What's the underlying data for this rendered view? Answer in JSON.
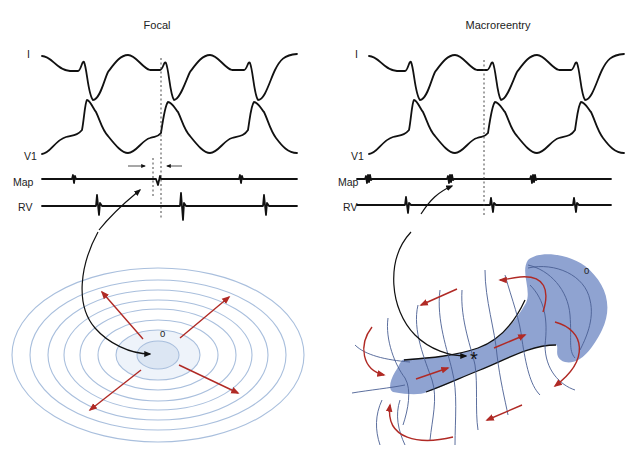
{
  "panels": [
    {
      "id": "focal",
      "title": "Focal",
      "leads": [
        "I",
        "V1",
        "Map",
        "RV"
      ],
      "activation_origin_label": "0"
    },
    {
      "id": "macroreentry",
      "title": "Macroreentry",
      "leads": [
        "I",
        "V1",
        "Map",
        "RV"
      ],
      "activation_origin_label": "0",
      "marker": "*"
    }
  ],
  "colors": {
    "trace": "#111111",
    "isochrone_ring": "#a9bfdd",
    "focus_fill": "#dce6f3",
    "circuit_fill": "#8fa3d1",
    "arrow_red": "#b02a25"
  }
}
